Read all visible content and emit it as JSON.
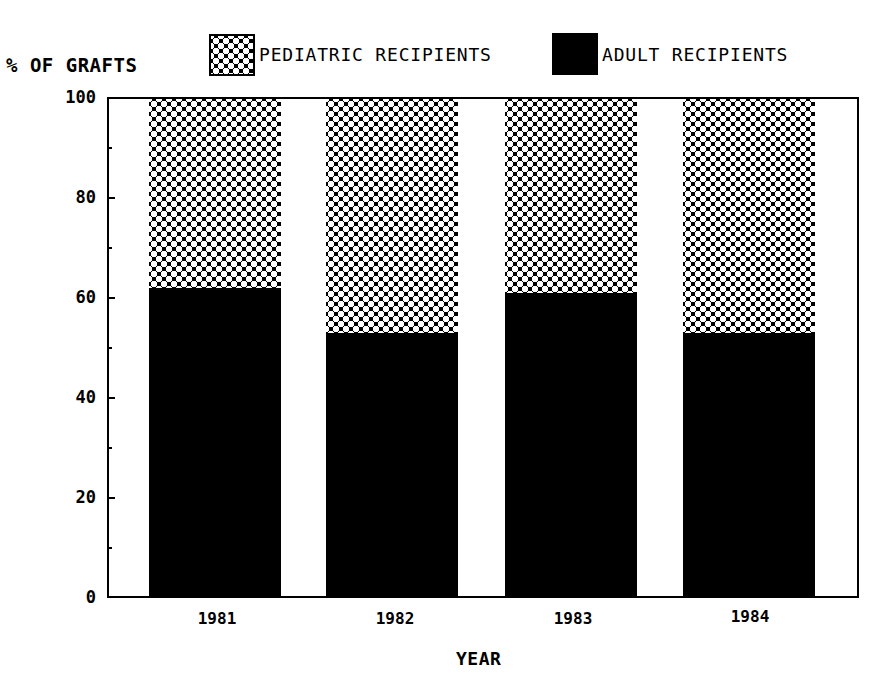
{
  "chart_data": {
    "type": "bar",
    "stacked": true,
    "title": "",
    "xlabel": "YEAR",
    "ylabel": "% OF GRAFTS",
    "ylim": [
      0,
      100
    ],
    "yticks": [
      0,
      20,
      40,
      60,
      80,
      100
    ],
    "yticks_minor": [
      10,
      30,
      50,
      70,
      90
    ],
    "grid": false,
    "legend_position": "top",
    "categories": [
      "1981",
      "1982",
      "1983",
      "1984"
    ],
    "series": [
      {
        "name": "ADULT RECIPIENTS",
        "fill": "solid black",
        "values": [
          62,
          53,
          61,
          53
        ]
      },
      {
        "name": "PEDIATRIC RECIPIENTS",
        "fill": "crosshatch",
        "values": [
          38,
          47,
          39,
          47
        ]
      }
    ]
  },
  "labels": {
    "y_title": "% OF GRAFTS",
    "x_title": "YEAR",
    "legend": {
      "pediatric": "PEDIATRIC RECIPIENTS",
      "adult": "ADULT RECIPIENTS"
    },
    "yticks": [
      "0",
      "20",
      "40",
      "60",
      "80",
      "100"
    ],
    "xticks": [
      "1981",
      "1982",
      "1983",
      "1984"
    ]
  },
  "colors": {
    "adult": "#000000",
    "pediatric_bg": "#000000",
    "pediatric_dots": "#ffffff",
    "background": "#ffffff"
  }
}
